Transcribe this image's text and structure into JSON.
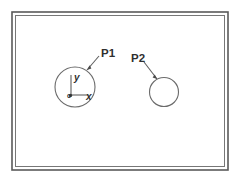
{
  "figure": {
    "background_color": "#ffffff",
    "line_color": "#5f5f5f",
    "frame": {
      "name": "drawing-border",
      "style": "double-line rectangle"
    },
    "parts": [
      {
        "id": "P1",
        "label": "P1",
        "shape": "circle",
        "center": {
          "x": 75,
          "y": 87
        },
        "radius": 20,
        "has_coordinate_frame": true
      },
      {
        "id": "P2",
        "label": "P2",
        "shape": "circle",
        "center": {
          "x": 164,
          "y": 92
        },
        "radius": 14.5,
        "has_coordinate_frame": false
      }
    ],
    "coordinate_frame": {
      "name": "local-frame-p1",
      "origin_label": "o",
      "x_axis_label": "x",
      "y_axis_label": "y",
      "origin": {
        "x": 71,
        "y": 95
      }
    }
  }
}
